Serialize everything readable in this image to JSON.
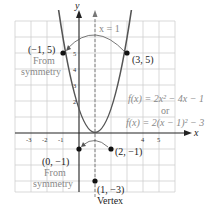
{
  "figure": {
    "function_line1": "f(x) = 2x² − 4x − 1",
    "function_or": "or",
    "function_line2": "f(x) = 2(x − 1)² − 3",
    "axis_of_symmetry_label": "x = 1",
    "x_axis_label": "x",
    "y_axis_label": "y",
    "x_ticks": [
      "-3",
      "-2",
      "-1",
      "4",
      "5"
    ],
    "y_ticks": [
      "5",
      "4",
      "3",
      "2"
    ],
    "points": [
      {
        "label": "(−1, 5)",
        "note1": "From",
        "note2": "symmetry"
      },
      {
        "label": "(3, 5)"
      },
      {
        "label": "(0, −1)",
        "note1": "From",
        "note2": "symmetry"
      },
      {
        "label": "(2, −1)"
      },
      {
        "label": "(1, −3)",
        "note1": "Vertex"
      }
    ]
  },
  "colors": {
    "curve": "#555555",
    "grid": "#cccccc",
    "axis": "#222222",
    "equation": "#888888"
  }
}
